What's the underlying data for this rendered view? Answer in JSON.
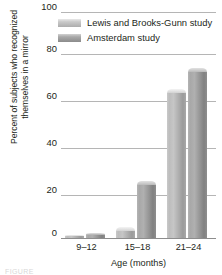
{
  "chart_data": {
    "type": "bar",
    "title": "",
    "xlabel": "Age (months)",
    "ylabel": "Percent of subjects who recognized themselves in a mirror",
    "ylabel_lines": [
      "Percent of subjects who recognized",
      "themselves in a mirror"
    ],
    "categories": [
      "9–12",
      "15–18",
      "21–24"
    ],
    "series": [
      {
        "name": "Lewis and Brooks-Gunn study",
        "values": [
          1,
          5,
          66
        ],
        "color": "#bdbdbd"
      },
      {
        "name": "Amsterdam study",
        "values": [
          2,
          25,
          75
        ],
        "color": "#9a9a9a"
      }
    ],
    "ylim": [
      0,
      100
    ],
    "yticks": [
      0,
      20,
      40,
      60,
      80,
      100
    ],
    "ytick_labels": [
      "0",
      "20",
      "40",
      "60",
      "80",
      "100"
    ],
    "grid": true,
    "legend_position": "top-right"
  },
  "caption": "FIGURE",
  "colors": {
    "gridline": "#b5b5b5",
    "axis": "#8d8d8d",
    "text": "#231f20",
    "background": "#ffffff"
  }
}
